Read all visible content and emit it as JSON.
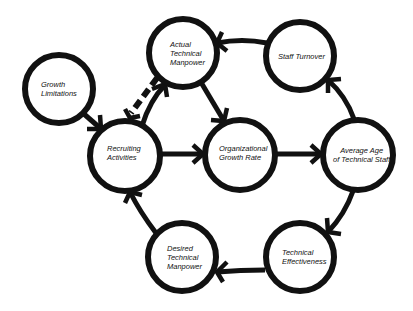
{
  "diagram": {
    "type": "causal-loop",
    "colors": {
      "stroke": "#111111",
      "background": "#ffffff"
    },
    "nodes": [
      {
        "id": "growth_limitations",
        "label_lines": [
          "Growth",
          "Limitations"
        ],
        "cx": 59,
        "cy": 89,
        "r": 34
      },
      {
        "id": "actual_technical_manpower",
        "label_lines": [
          "Actual",
          "Technical",
          "Manpower"
        ],
        "cx": 183,
        "cy": 53,
        "r": 34
      },
      {
        "id": "staff_turnover",
        "label_lines": [
          "Staff Turnover"
        ],
        "cx": 300,
        "cy": 56,
        "r": 34
      },
      {
        "id": "recruiting_activities",
        "label_lines": [
          "Recruiting",
          "Activities"
        ],
        "cx": 125,
        "cy": 156,
        "r": 35
      },
      {
        "id": "organizational_growth_rate",
        "label_lines": [
          "Organizational",
          "Growth Rate"
        ],
        "cx": 240,
        "cy": 155,
        "r": 35
      },
      {
        "id": "average_age_of_technical_staff",
        "label_lines": [
          "Average Age",
          "of Technical Staff"
        ],
        "cx": 358,
        "cy": 155,
        "r": 35
      },
      {
        "id": "desired_technical_manpower",
        "label_lines": [
          "Desired",
          "Technical",
          "Manpower"
        ],
        "cx": 182,
        "cy": 257,
        "r": 34
      },
      {
        "id": "technical_effectiveness",
        "label_lines": [
          "Technical",
          "Effectiveness"
        ],
        "cx": 300,
        "cy": 257,
        "r": 34
      }
    ],
    "edges": [
      {
        "from": "growth_limitations",
        "to": "recruiting_activities",
        "style": "solid"
      },
      {
        "from": "actual_technical_manpower",
        "to": "recruiting_activities",
        "style": "dashed"
      },
      {
        "from": "recruiting_activities",
        "to": "actual_technical_manpower",
        "style": "solid"
      },
      {
        "from": "actual_technical_manpower",
        "to": "organizational_growth_rate",
        "style": "solid"
      },
      {
        "from": "staff_turnover",
        "to": "actual_technical_manpower",
        "style": "solid"
      },
      {
        "from": "recruiting_activities",
        "to": "organizational_growth_rate",
        "style": "solid"
      },
      {
        "from": "organizational_growth_rate",
        "to": "average_age_of_technical_staff",
        "style": "solid"
      },
      {
        "from": "average_age_of_technical_staff",
        "to": "staff_turnover",
        "style": "solid"
      },
      {
        "from": "average_age_of_technical_staff",
        "to": "technical_effectiveness",
        "style": "solid"
      },
      {
        "from": "technical_effectiveness",
        "to": "desired_technical_manpower",
        "style": "solid"
      },
      {
        "from": "desired_technical_manpower",
        "to": "recruiting_activities",
        "style": "solid"
      }
    ]
  },
  "labels": {
    "growth_limitations": {
      "l1": "Growth",
      "l2": "Limitations"
    },
    "actual_technical_manpower": {
      "l1": "Actual",
      "l2": "Technical",
      "l3": "Manpower"
    },
    "staff_turnover": {
      "l1": "Staff Turnover"
    },
    "recruiting_activities": {
      "l1": "Recruiting",
      "l2": "Activities"
    },
    "organizational_growth_rate": {
      "l1": "Organizational",
      "l2": "Growth Rate"
    },
    "average_age_of_technical_staff": {
      "l1": "Average Age",
      "l2": "of Technical Staff"
    },
    "desired_technical_manpower": {
      "l1": "Desired",
      "l2": "Technical",
      "l3": "Manpower"
    },
    "technical_effectiveness": {
      "l1": "Technical",
      "l2": "Effectiveness"
    }
  }
}
